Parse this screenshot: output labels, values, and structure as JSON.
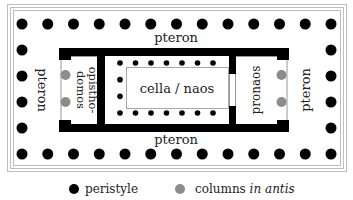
{
  "diagram": {
    "labels": {
      "pteron_top": "pteron",
      "pteron_bottom": "pteron",
      "pteron_left": "pteron",
      "pteron_right": "pteron",
      "opisthodomos_line1": "opistho-",
      "opisthodomos_line2": "domos",
      "cella": "cella / naos",
      "pronaos": "pronaos"
    },
    "peristyle": {
      "columns_front": 13,
      "columns_side": 6,
      "color": "#000000"
    },
    "columns_in_antis": {
      "count_each_end": 2,
      "color": "#8c8c8c"
    },
    "cella_inner_colonnade": {
      "top_row": 7,
      "bottom_row": 7,
      "back_side": 2
    },
    "frame_color": "#b8b8b8"
  },
  "legend": {
    "items": [
      {
        "label": "peristyle",
        "color": "#000000"
      },
      {
        "label_plain": "columns ",
        "label_italic": "in antis",
        "color": "#8c8c8c"
      }
    ]
  }
}
